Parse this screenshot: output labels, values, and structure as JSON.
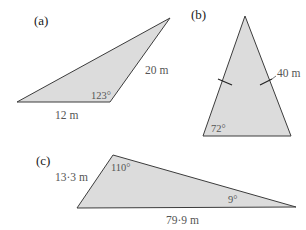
{
  "figures": [
    {
      "part_label": "(a)",
      "side_labels": [
        "20 m",
        "12 m"
      ],
      "angle_labels": [
        "123°"
      ]
    },
    {
      "part_label": "(b)",
      "side_labels": [
        "40 m"
      ],
      "angle_labels": [
        "72°"
      ]
    },
    {
      "part_label": "(c)",
      "side_labels": [
        "13·3 m",
        "79·9 m"
      ],
      "angle_labels": [
        "110°",
        "9°"
      ]
    }
  ],
  "colors": {
    "fill": "#dcdcdc",
    "stroke": "#3c3c3c"
  }
}
